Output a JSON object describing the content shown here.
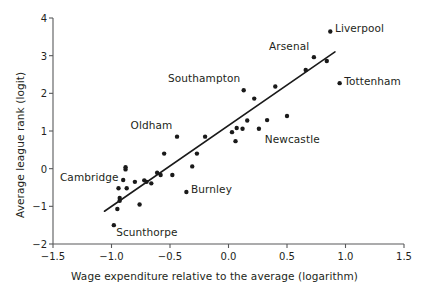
{
  "chart_data": {
    "type": "scatter",
    "title": "",
    "xlabel": "Wage expenditure relative to the average (logarithm)",
    "ylabel": "Average league rank (logit)",
    "xlim": [
      -1.5,
      1.5
    ],
    "ylim": [
      -2,
      4
    ],
    "xticks": [
      -1.5,
      -1.0,
      -0.5,
      0.0,
      0.5,
      1.0,
      1.5
    ],
    "xticklabels": [
      "−1.5",
      "−1.0",
      "−0.5",
      "0.0",
      "0.5",
      "1.0",
      "1.5"
    ],
    "yticks": [
      -2,
      -1,
      0,
      1,
      2,
      3,
      4
    ],
    "yticklabels": [
      "−2",
      "−1",
      "0",
      "1",
      "2",
      "3",
      "4"
    ],
    "grid": false,
    "legend": "none",
    "marker_color": "#1a1a1a",
    "line_color": "#1a1a1a",
    "axis_color": "#58595b",
    "points": [
      {
        "x": -0.98,
        "y": -1.5,
        "label": "Scunthorpe"
      },
      {
        "x": -0.95,
        "y": -1.07,
        "label": ""
      },
      {
        "x": -0.93,
        "y": -0.85,
        "label": ""
      },
      {
        "x": -0.93,
        "y": -0.78,
        "label": ""
      },
      {
        "x": -0.94,
        "y": -0.52,
        "label": ""
      },
      {
        "x": -0.9,
        "y": -0.3,
        "label": "Cambridge"
      },
      {
        "x": -0.88,
        "y": -0.02,
        "label": ""
      },
      {
        "x": -0.88,
        "y": 0.04,
        "label": ""
      },
      {
        "x": -0.87,
        "y": -0.52,
        "label": ""
      },
      {
        "x": -0.8,
        "y": -0.35,
        "label": ""
      },
      {
        "x": -0.76,
        "y": -0.95,
        "label": ""
      },
      {
        "x": -0.72,
        "y": -0.31,
        "label": ""
      },
      {
        "x": -0.7,
        "y": -0.35,
        "label": ""
      },
      {
        "x": -0.66,
        "y": -0.39,
        "label": ""
      },
      {
        "x": -0.61,
        "y": -0.11,
        "label": ""
      },
      {
        "x": -0.58,
        "y": -0.17,
        "label": ""
      },
      {
        "x": -0.55,
        "y": 0.4,
        "label": ""
      },
      {
        "x": -0.48,
        "y": -0.17,
        "label": ""
      },
      {
        "x": -0.44,
        "y": 0.85,
        "label": "Oldham"
      },
      {
        "x": -0.36,
        "y": -0.62,
        "label": "Burnley"
      },
      {
        "x": -0.31,
        "y": 0.06,
        "label": ""
      },
      {
        "x": -0.27,
        "y": 0.4,
        "label": ""
      },
      {
        "x": -0.2,
        "y": 0.85,
        "label": ""
      },
      {
        "x": 0.03,
        "y": 0.97,
        "label": ""
      },
      {
        "x": 0.06,
        "y": 0.73,
        "label": ""
      },
      {
        "x": 0.07,
        "y": 1.08,
        "label": ""
      },
      {
        "x": 0.12,
        "y": 1.06,
        "label": ""
      },
      {
        "x": 0.13,
        "y": 2.08,
        "label": "Southampton"
      },
      {
        "x": 0.16,
        "y": 1.28,
        "label": ""
      },
      {
        "x": 0.22,
        "y": 1.86,
        "label": ""
      },
      {
        "x": 0.26,
        "y": 1.06,
        "label": "Newcastle"
      },
      {
        "x": 0.33,
        "y": 1.29,
        "label": ""
      },
      {
        "x": 0.4,
        "y": 2.18,
        "label": ""
      },
      {
        "x": 0.5,
        "y": 1.4,
        "label": ""
      },
      {
        "x": 0.66,
        "y": 2.62,
        "label": ""
      },
      {
        "x": 0.73,
        "y": 2.96,
        "label": "Arsenal"
      },
      {
        "x": 0.84,
        "y": 2.86,
        "label": ""
      },
      {
        "x": 0.87,
        "y": 3.64,
        "label": "Liverpool"
      },
      {
        "x": 0.95,
        "y": 2.27,
        "label": "Tottenham"
      }
    ],
    "trendline": {
      "x0": -1.06,
      "y0": -1.13,
      "x1": 0.91,
      "y1": 3.1
    }
  },
  "annotations": [
    {
      "name": "liverpool",
      "text": "Liverpool",
      "x": 0.91,
      "y": 3.7,
      "anchor": "left"
    },
    {
      "name": "arsenal",
      "text": "Arsenal",
      "x": 0.69,
      "y": 3.22,
      "anchor": "right"
    },
    {
      "name": "tottenham",
      "text": "Tottenham",
      "x": 0.99,
      "y": 2.3,
      "anchor": "left"
    },
    {
      "name": "southampton",
      "text": "Southampton",
      "x": 0.1,
      "y": 2.38,
      "anchor": "right"
    },
    {
      "name": "newcastle",
      "text": "Newcastle",
      "x": 0.31,
      "y": 0.77,
      "anchor": "left"
    },
    {
      "name": "oldham",
      "text": "Oldham",
      "x": -0.48,
      "y": 1.12,
      "anchor": "right"
    },
    {
      "name": "burnley",
      "text": "Burnley",
      "x": -0.32,
      "y": -0.57,
      "anchor": "left"
    },
    {
      "name": "cambridge",
      "text": "Cambridge",
      "x": -0.94,
      "y": -0.26,
      "anchor": "right"
    },
    {
      "name": "scunthorpe",
      "text": "Scunthorpe",
      "x": -0.96,
      "y": -1.72,
      "anchor": "left"
    }
  ]
}
